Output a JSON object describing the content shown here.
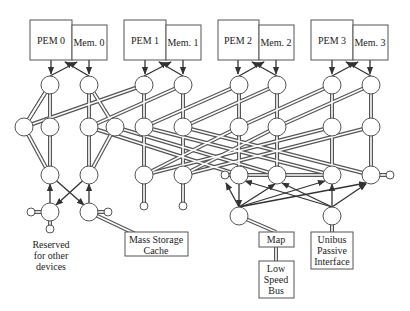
{
  "pem_units": [
    {
      "pem": "PEM 0",
      "mem": "Mem. 0"
    },
    {
      "pem": "PEM 1",
      "mem": "Mem. 1"
    },
    {
      "pem": "PEM 2",
      "mem": "Mem. 2"
    },
    {
      "pem": "PEM 3",
      "mem": "Mem. 3"
    }
  ],
  "devices": {
    "reserved": [
      "Reserved",
      "for other",
      "devices"
    ],
    "mass_storage": [
      "Mass Storage",
      "Cache"
    ],
    "map": "Map",
    "low_speed_bus": [
      "Low",
      "Speed",
      "Bus"
    ],
    "unibus": [
      "Unibus",
      "Passive",
      "Interface"
    ]
  },
  "colors": {
    "line": "#444444",
    "node_fill": "#ffffff",
    "box_stroke": "#555555",
    "text": "#222222"
  }
}
